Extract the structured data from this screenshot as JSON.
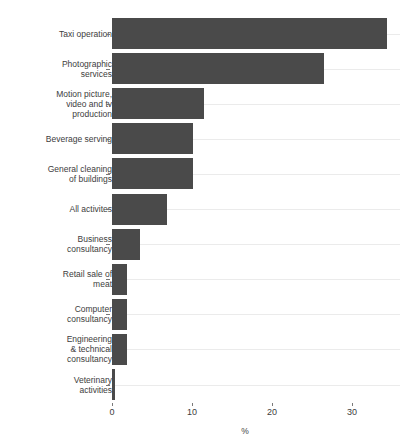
{
  "chart_data": {
    "type": "bar",
    "orientation": "horizontal",
    "title": "",
    "subtitle": "",
    "xlabel": "%",
    "ylabel": "",
    "xlim": [
      0,
      36
    ],
    "xticks": [
      0,
      10,
      20,
      30
    ],
    "xtick_labels": [
      "0",
      "10",
      "20",
      "30"
    ],
    "grid": "horizontal",
    "legend": "none",
    "bar_color": "#4a4a4a",
    "gridline_color": "#ebebeb",
    "background_color": "#ffffff",
    "categories": [
      "Taxi operation",
      "Photographic\nservices",
      "Motion picture,\nvideo and tv\nproduction",
      "Beverage serving",
      "General cleaning\nof buildings",
      "All activites",
      "Business\nconsultancy",
      "Retail sale of\nmeat",
      "Computer\nconsultancy",
      "Engineering\n& technical\nconsultancy",
      "Veterinary\nactivities"
    ],
    "values": [
      34.4,
      26.5,
      11.5,
      10.1,
      10.1,
      6.9,
      3.5,
      1.9,
      1.9,
      1.9,
      0.4
    ]
  },
  "axis": {
    "x_title": "%"
  }
}
